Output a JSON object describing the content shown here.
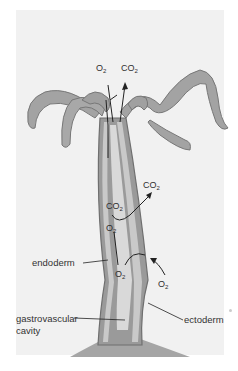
{
  "figure": {
    "labels": {
      "endoderm": "endoderm",
      "gastrovascular_cavity_line1": "gastrovascular",
      "gastrovascular_cavity_line2": "cavity",
      "ectoderm": "ectoderm"
    },
    "gases": {
      "top_o2": {
        "symbol": "O",
        "sub": "2"
      },
      "top_co2": {
        "symbol": "CO",
        "sub": "2"
      },
      "mid_co2_out": {
        "symbol": "CO",
        "sub": "2"
      },
      "mid_co2_in": {
        "symbol": "CO",
        "sub": "2"
      },
      "mid_o2": {
        "symbol": "O",
        "sub": "2"
      },
      "low_o2_in": {
        "symbol": "O",
        "sub": "2"
      },
      "low_o2_out": {
        "symbol": "O",
        "sub": "2"
      }
    },
    "colors": {
      "background": "#f1f1f1",
      "body": "#9a9a9a",
      "body_dark": "#6f6f6f",
      "cells": "#c9c9c9",
      "base": "#a5a5a5"
    }
  }
}
